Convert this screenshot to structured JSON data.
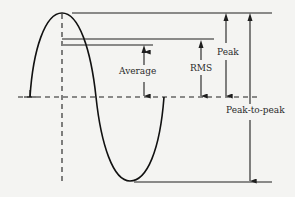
{
  "diagram": {
    "title": "",
    "labels": {
      "average": "Average",
      "rms": "RMS",
      "peak": "Peak",
      "peak_to_peak": "Peak-to-peak"
    },
    "waveform": "sine",
    "colors": {
      "ink": "#1e1e1e",
      "paper": "#f4f4f2"
    }
  }
}
